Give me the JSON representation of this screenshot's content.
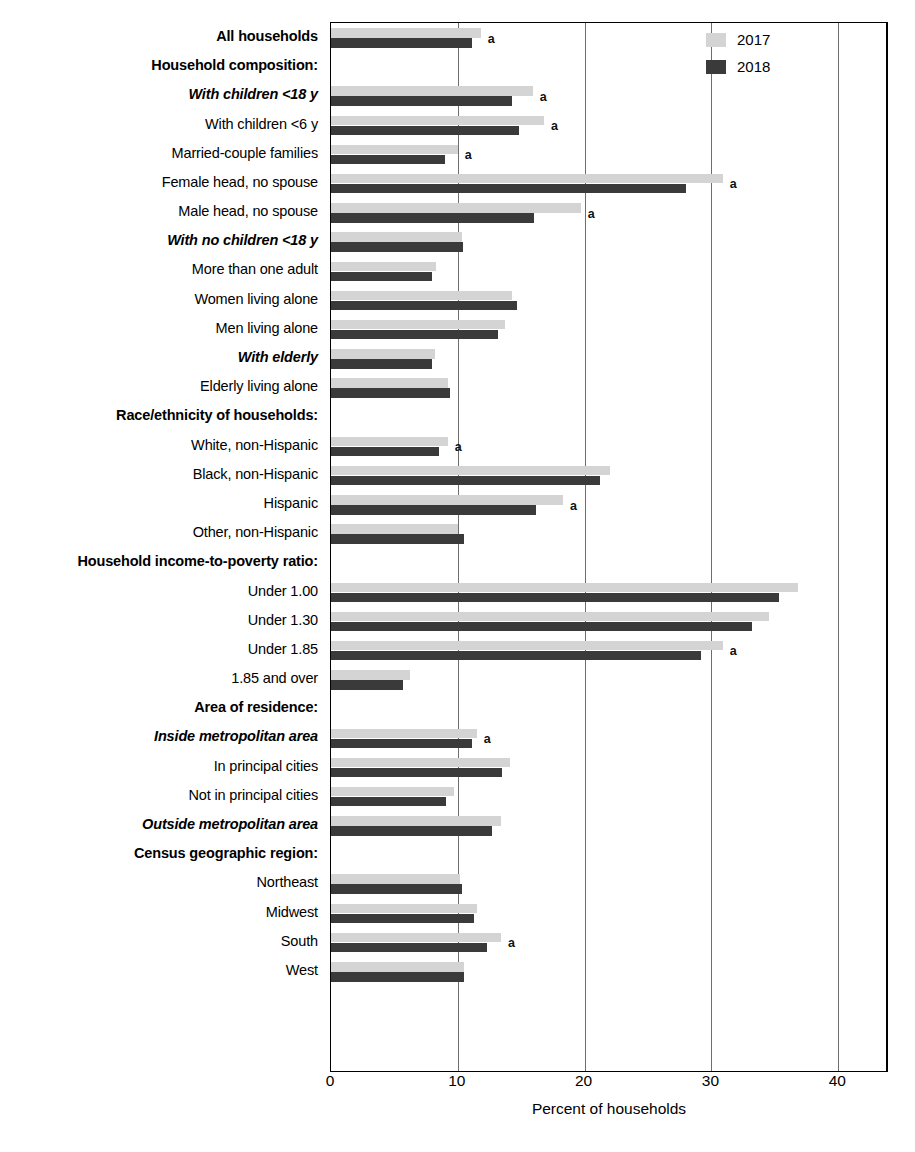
{
  "chart_data": {
    "type": "bar",
    "orientation": "horizontal",
    "title": "",
    "xlabel": "Percent of households",
    "ylabel": "",
    "xlim": [
      0,
      44
    ],
    "xticks": [
      0,
      10,
      20,
      30,
      40
    ],
    "xticklabels": [
      "0",
      "10",
      "20",
      "30",
      "40"
    ],
    "grid": "vertical gridlines at 10, 20, 30, 40",
    "legend": {
      "position": "top-right inside plot",
      "entries": [
        {
          "name": "2017",
          "color": "#d4d4d4"
        },
        {
          "name": "2018",
          "color": "#3a3a3a"
        }
      ]
    },
    "series": [
      {
        "name": "2017",
        "color": "#d4d4d4"
      },
      {
        "name": "2018",
        "color": "#3a3a3a"
      }
    ],
    "annotation_marker": "a",
    "rows": [
      {
        "label": "All households",
        "style": "header",
        "v2017": 11.8,
        "v2018": 11.1,
        "note": "a"
      },
      {
        "label": "Household composition:",
        "style": "header",
        "v2017": null,
        "v2018": null,
        "note": ""
      },
      {
        "label": "With children <18 y",
        "style": "subhead",
        "v2017": 15.9,
        "v2018": 14.3,
        "note": "a"
      },
      {
        "label": "With children <6 y",
        "style": "plain",
        "v2017": 16.8,
        "v2018": 14.8,
        "note": "a"
      },
      {
        "label": "Married-couple families",
        "style": "plain",
        "v2017": 10.0,
        "v2018": 9.0,
        "note": "a"
      },
      {
        "label": "Female head, no spouse",
        "style": "plain",
        "v2017": 30.9,
        "v2018": 28.0,
        "note": "a"
      },
      {
        "label": "Male head, no spouse",
        "style": "plain",
        "v2017": 19.7,
        "v2018": 16.0,
        "note": "a"
      },
      {
        "label": "With no children <18 y",
        "style": "subhead",
        "v2017": 10.3,
        "v2018": 10.4,
        "note": ""
      },
      {
        "label": "More than one adult",
        "style": "plain",
        "v2017": 8.3,
        "v2018": 8.0,
        "note": ""
      },
      {
        "label": "Women living alone",
        "style": "plain",
        "v2017": 14.3,
        "v2018": 14.7,
        "note": ""
      },
      {
        "label": "Men living alone",
        "style": "plain",
        "v2017": 13.7,
        "v2018": 13.2,
        "note": ""
      },
      {
        "label": "With elderly",
        "style": "subhead",
        "v2017": 8.2,
        "v2018": 8.0,
        "note": ""
      },
      {
        "label": "Elderly living alone",
        "style": "plain",
        "v2017": 9.2,
        "v2018": 9.4,
        "note": ""
      },
      {
        "label": "Race/ethnicity of households:",
        "style": "header",
        "v2017": null,
        "v2018": null,
        "note": ""
      },
      {
        "label": "White, non-Hispanic",
        "style": "plain",
        "v2017": 9.2,
        "v2018": 8.5,
        "note": "a"
      },
      {
        "label": "Black, non-Hispanic",
        "style": "plain",
        "v2017": 22.0,
        "v2018": 21.2,
        "note": ""
      },
      {
        "label": "Hispanic",
        "style": "plain",
        "v2017": 18.3,
        "v2018": 16.2,
        "note": "a"
      },
      {
        "label": "Other, non-Hispanic",
        "style": "plain",
        "v2017": 10.0,
        "v2018": 10.5,
        "note": ""
      },
      {
        "label": "Household income-to-poverty ratio:",
        "style": "header",
        "v2017": null,
        "v2018": null,
        "note": ""
      },
      {
        "label": "Under 1.00",
        "style": "plain",
        "v2017": 36.8,
        "v2018": 35.3,
        "note": ""
      },
      {
        "label": "Under 1.30",
        "style": "plain",
        "v2017": 34.5,
        "v2018": 33.2,
        "note": ""
      },
      {
        "label": "Under 1.85",
        "style": "plain",
        "v2017": 30.9,
        "v2018": 29.2,
        "note": "a"
      },
      {
        "label": "1.85 and over",
        "style": "plain",
        "v2017": 6.2,
        "v2018": 5.7,
        "note": ""
      },
      {
        "label": "Area of residence:",
        "style": "header",
        "v2017": null,
        "v2018": null,
        "note": ""
      },
      {
        "label": "Inside metropolitan area",
        "style": "subhead",
        "v2017": 11.5,
        "v2018": 11.1,
        "note": "a"
      },
      {
        "label": "In principal cities",
        "style": "plain",
        "v2017": 14.1,
        "v2018": 13.5,
        "note": ""
      },
      {
        "label": "Not in principal cities",
        "style": "plain",
        "v2017": 9.7,
        "v2018": 9.1,
        "note": ""
      },
      {
        "label": "Outside metropolitan area",
        "style": "subhead",
        "v2017": 13.4,
        "v2018": 12.7,
        "note": ""
      },
      {
        "label": "Census geographic region:",
        "style": "header",
        "v2017": null,
        "v2018": null,
        "note": ""
      },
      {
        "label": "Northeast",
        "style": "plain",
        "v2017": 10.2,
        "v2018": 10.3,
        "note": ""
      },
      {
        "label": "Midwest",
        "style": "plain",
        "v2017": 11.5,
        "v2018": 11.3,
        "note": ""
      },
      {
        "label": "South",
        "style": "plain",
        "v2017": 13.4,
        "v2018": 12.3,
        "note": "a"
      },
      {
        "label": "West",
        "style": "plain",
        "v2017": 10.5,
        "v2018": 10.5,
        "note": ""
      }
    ]
  }
}
